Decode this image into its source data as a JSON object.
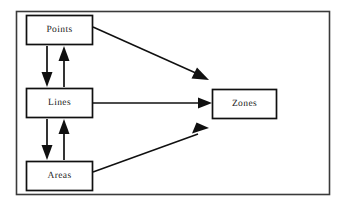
{
  "diagram": {
    "type": "flow-diagram",
    "frame": {
      "present": true,
      "border_color": "#3a3a3a",
      "background": "#ffffff"
    },
    "nodes": [
      {
        "id": "points",
        "label": "Points",
        "x": 26,
        "y": 15,
        "w": 67,
        "h": 30
      },
      {
        "id": "lines",
        "label": "Lines",
        "x": 26,
        "y": 88,
        "w": 67,
        "h": 30
      },
      {
        "id": "areas",
        "label": "Areas",
        "x": 26,
        "y": 161,
        "w": 67,
        "h": 30
      },
      {
        "id": "zones",
        "label": "Zones",
        "x": 212,
        "y": 89,
        "w": 65,
        "h": 30
      }
    ],
    "edges": [
      {
        "id": "points-to-lines",
        "from": "points",
        "to": "lines",
        "direction": "down",
        "style": "solid"
      },
      {
        "id": "lines-to-points",
        "from": "lines",
        "to": "points",
        "direction": "up",
        "style": "solid"
      },
      {
        "id": "lines-to-areas",
        "from": "lines",
        "to": "areas",
        "direction": "down",
        "style": "solid"
      },
      {
        "id": "areas-to-lines",
        "from": "areas",
        "to": "lines",
        "direction": "up",
        "style": "solid"
      },
      {
        "id": "points-to-zones",
        "from": "points",
        "to": "zones",
        "direction": "diagonal-down-right",
        "style": "solid"
      },
      {
        "id": "lines-to-zones",
        "from": "lines",
        "to": "zones",
        "direction": "right",
        "style": "solid"
      },
      {
        "id": "areas-to-zones",
        "from": "areas",
        "to": "zones",
        "direction": "diagonal-up-right",
        "style": "solid"
      }
    ],
    "colors": {
      "line": "#101010",
      "node_border": "#101010",
      "text": "#1a1a1a"
    }
  }
}
